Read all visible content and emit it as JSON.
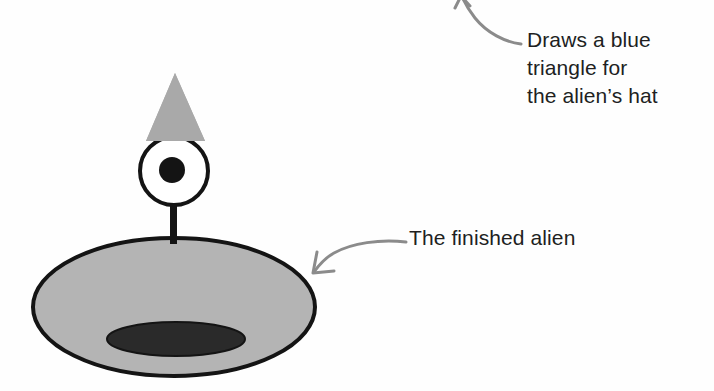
{
  "figure": {
    "kind": "illustration",
    "background_color": "#fefefe"
  },
  "annotations": [
    {
      "id": "hat",
      "text": "Draws a blue\ntriangle for\nthe alien’s hat",
      "lines": [
        "Draws a blue",
        "triangle for",
        "the alien’s hat"
      ],
      "arrow": "curved arrow pointing up-left, arrowhead cropped at top edge",
      "color": "#211f1f"
    },
    {
      "id": "alien",
      "text": "The finished alien",
      "lines": [
        "The finished alien"
      ],
      "arrow": "curved arrow pointing down-left to right edge of body",
      "color": "#211f1f"
    }
  ],
  "alien": {
    "hat": {
      "shape": "triangle",
      "fill": "#a9a9a9",
      "described_color": "blue",
      "apex": [
        175,
        73
      ],
      "base_left": [
        146,
        141
      ],
      "base_right": [
        205,
        141
      ]
    },
    "head": {
      "shape": "circle",
      "fill": "#ffffff",
      "stroke": "#141414",
      "center": [
        174,
        171
      ],
      "radius": 34
    },
    "eye": {
      "shape": "circle",
      "fill": "#141414",
      "center": [
        172,
        170
      ],
      "radius": 13
    },
    "neck": {
      "shape": "rect",
      "fill": "#141414",
      "x": 170,
      "y": 206,
      "width": 7,
      "height": 38
    },
    "body": {
      "shape": "ellipse",
      "fill": "#b4b4b4",
      "stroke": "#141414",
      "center": [
        174,
        307
      ],
      "rx": 141,
      "ry": 69
    },
    "body_shadow": {
      "shape": "ellipse",
      "fill": "#2a2a2a",
      "center": [
        176,
        339
      ],
      "rx": 69,
      "ry": 17
    }
  },
  "arrow_style": {
    "stroke": "#8b8b8b",
    "stroke_width": 3
  }
}
